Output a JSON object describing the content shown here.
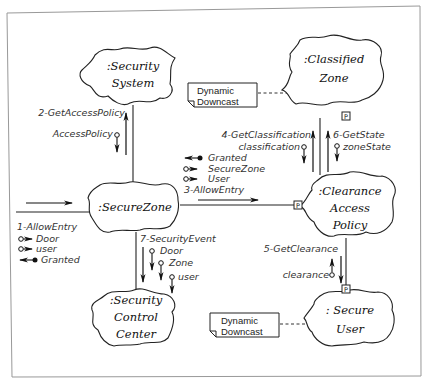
{
  "diagram": {
    "type": "collaboration-diagram",
    "objects": [
      {
        "id": "security_system",
        "lines": [
          ":Security",
          "System"
        ]
      },
      {
        "id": "classified_zone",
        "lines": [
          ":Classified",
          "Zone"
        ]
      },
      {
        "id": "secure_zone",
        "lines": [
          ":SecureZone"
        ]
      },
      {
        "id": "clearance_access_policy",
        "lines": [
          ":Clearance",
          "Access",
          "Policy"
        ]
      },
      {
        "id": "security_control_center",
        "lines": [
          ":Security",
          "Control",
          "Center"
        ]
      },
      {
        "id": "secure_user",
        "lines": [
          ": Secure",
          "User"
        ]
      }
    ],
    "notes": [
      {
        "id": "note_classified",
        "lines": [
          "Dynamic",
          "Downcast"
        ],
        "attached_to": "classified_zone"
      },
      {
        "id": "note_secure_user",
        "lines": [
          "Dynamic",
          "Downcast"
        ],
        "attached_to": "secure_user"
      }
    ],
    "port_marker": "P",
    "messages": [
      {
        "id": "m1",
        "label": "1-AllowEntry",
        "to": "secure_zone",
        "params": [
          {
            "name": "Door",
            "kind": "in"
          },
          {
            "name": "user",
            "kind": "in"
          },
          {
            "name": "Granted",
            "kind": "out"
          }
        ]
      },
      {
        "id": "m2",
        "label": "2-GetAccessPolicy",
        "from": "secure_zone",
        "to": "security_system",
        "params": [
          {
            "name": "AccessPolicy",
            "kind": "return"
          }
        ]
      },
      {
        "id": "m3",
        "label": "3-AllowEntry",
        "from": "secure_zone",
        "to": "clearance_access_policy",
        "params": [
          {
            "name": "Granted",
            "kind": "out"
          },
          {
            "name": "SecureZone",
            "kind": "in"
          },
          {
            "name": "User",
            "kind": "in"
          }
        ]
      },
      {
        "id": "m4",
        "label": "4-GetClassification",
        "from": "clearance_access_policy",
        "to": "classified_zone",
        "params": [
          {
            "name": "classification",
            "kind": "return"
          }
        ]
      },
      {
        "id": "m5",
        "label": "5-GetClearance",
        "from": "clearance_access_policy",
        "to": "secure_user",
        "params": [
          {
            "name": "clearance",
            "kind": "return"
          }
        ]
      },
      {
        "id": "m6",
        "label": "6-GetState",
        "from": "clearance_access_policy",
        "to": "classified_zone",
        "params": [
          {
            "name": "zoneState",
            "kind": "return"
          }
        ]
      },
      {
        "id": "m7",
        "label": "7-SecurityEvent",
        "from": "secure_zone",
        "to": "security_control_center",
        "params": [
          {
            "name": "Door",
            "kind": "in"
          },
          {
            "name": "Zone",
            "kind": "in"
          },
          {
            "name": "user",
            "kind": "in"
          }
        ]
      }
    ]
  }
}
